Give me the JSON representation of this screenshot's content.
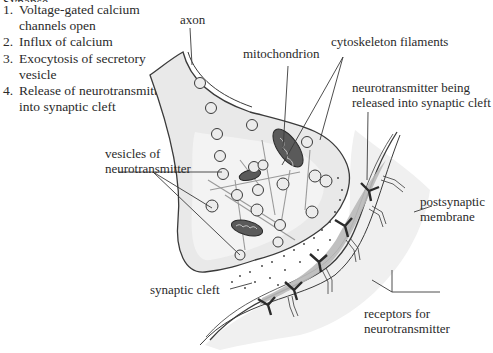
{
  "title": "Synapse",
  "steps": [
    {
      "num": "1.",
      "line1": "Voltage-gated calcium",
      "line2": "channels open"
    },
    {
      "num": "2.",
      "line1": "Influx of calcium",
      "line2": ""
    },
    {
      "num": "3.",
      "line1": "Exocytosis of secretory",
      "line2": "vesicle"
    },
    {
      "num": "4.",
      "line1": "Release of neurotransmitter",
      "line2": "into synaptic cleft"
    }
  ],
  "labels": {
    "axon": "axon",
    "mitochondrion": "mitochondrion",
    "cytoskeleton": "cytoskeleton filaments",
    "nt_released_1": "neurotransmitter being",
    "nt_released_2": "released into synaptic cleft",
    "vesicles_1": "vesicles of",
    "vesicles_2": "neurotransmitter",
    "postsynaptic_1": "postsynaptic",
    "postsynaptic_2": "membrane",
    "synaptic_cleft": "synaptic cleft",
    "receptors_1": "receptors for",
    "receptors_2": "neurotransmitter"
  },
  "colors": {
    "cell_fill": "#e9e9e9",
    "cell_inner": "#f2f2f2",
    "outline": "#3a3a3a",
    "post_band": "#b9b9b9",
    "mito_fill": "#5a5a5a",
    "filament": "#9a9a9a"
  }
}
